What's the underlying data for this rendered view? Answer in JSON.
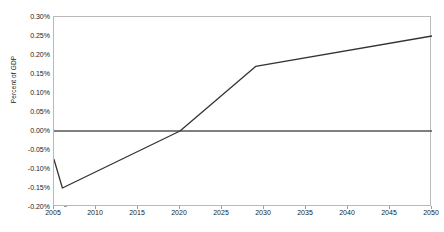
{
  "chart_data": {
    "type": "line",
    "title": "",
    "subtitle": "",
    "xlabel": "",
    "ylabel": "Percent of GDP",
    "xlim": [
      2005,
      2050
    ],
    "ylim": [
      -0.2,
      0.3
    ],
    "grid": false,
    "legend": false,
    "legend_position": "none",
    "y_tick_labels": [
      "0.30%",
      "0.25%",
      "0.20%",
      "0.15%",
      "0.10%",
      "0.05%",
      "0.00%",
      "-0.05%",
      "-0.10%",
      "-0.15%",
      "-0.20%"
    ],
    "y_tick_values": [
      0.3,
      0.25,
      0.2,
      0.15,
      0.1,
      0.05,
      0.0,
      -0.05,
      -0.1,
      -0.15,
      -0.2
    ],
    "y_tick_step": 0.05,
    "x_tick_labels": [
      "2005",
      "2010",
      "2015",
      "2020",
      "2025",
      "2030",
      "2035",
      "2040",
      "2045",
      "2050"
    ],
    "x_tick_values": [
      2005,
      2010,
      2015,
      2020,
      2025,
      2030,
      2035,
      2040,
      2045,
      2050
    ],
    "x_tick_step": 5,
    "zero_reference_line": 0.0,
    "series": [
      {
        "name": "Percent of GDP",
        "color": "#333333",
        "x": [
          2005,
          2006,
          2020,
          2029,
          2050
        ],
        "values": [
          -0.075,
          -0.15,
          0.0,
          0.17,
          0.25
        ]
      }
    ],
    "annotations": []
  },
  "colors": {
    "line": "#333333",
    "zero_line": "#555555",
    "frame": "#b9b9b9",
    "tick": "#9a9a9a",
    "text": "#1a1a1a",
    "background": "#ffffff"
  }
}
